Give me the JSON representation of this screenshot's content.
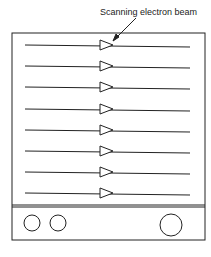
{
  "diagram": {
    "label": "Scanning electron beam",
    "scan_line_count": 8,
    "knobs": [
      "small-knob-1",
      "small-knob-2",
      "large-knob"
    ],
    "colors": {
      "stroke": "#222222",
      "background": "#ffffff"
    }
  }
}
